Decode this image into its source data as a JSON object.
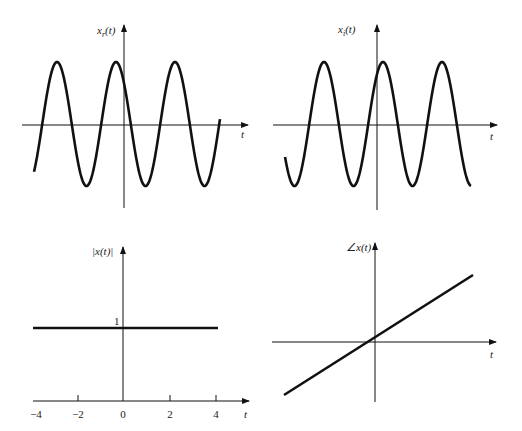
{
  "chart_data": [
    {
      "type": "line",
      "title": "",
      "ylabel": "x_r(t)",
      "xlabel": "t",
      "description": "Real part of complex exponential: cosine wave, three cycles",
      "amplitude": 1,
      "grid": false,
      "series": [
        {
          "name": "x_r(t)",
          "function": "cos(w0 t)"
        }
      ]
    },
    {
      "type": "line",
      "title": "",
      "ylabel": "x_i(t)",
      "xlabel": "t",
      "description": "Imaginary part of complex exponential: sine wave, three cycles",
      "amplitude": 1,
      "grid": false,
      "series": [
        {
          "name": "x_i(t)",
          "function": "sin(w0 t)"
        }
      ]
    },
    {
      "type": "line",
      "title": "",
      "ylabel": "|x(t)|",
      "xlabel": "t",
      "x": [
        -4,
        4
      ],
      "series": [
        {
          "name": "|x(t)|",
          "values": [
            1,
            1
          ]
        }
      ],
      "xticks": [
        "-4",
        "-2",
        "0",
        "2",
        "4"
      ],
      "yticks": [
        "1"
      ],
      "xlim": [
        -4,
        4
      ],
      "grid": false
    },
    {
      "type": "line",
      "title": "",
      "ylabel": "∠x(t)",
      "xlabel": "t",
      "description": "Phase increases linearly with t",
      "series": [
        {
          "name": "∠x(t)",
          "slope": "positive, linear"
        }
      ],
      "grid": false
    }
  ],
  "panels": {
    "xr": {
      "ylabel_main": "x",
      "ylabel_sub": "r",
      "ylabel_tail": "(t)",
      "xlabel": "t"
    },
    "xi": {
      "ylabel_main": "x",
      "ylabel_sub": "i",
      "ylabel_tail": "(t)",
      "xlabel": "t"
    },
    "mag": {
      "ylabel": "|x(t)|",
      "xlabel": "t",
      "ytick": "1",
      "xticks": [
        "−4",
        "−2",
        "0",
        "2",
        "4"
      ]
    },
    "phase": {
      "ylabel": "∠x(t)",
      "xlabel": "t"
    }
  }
}
